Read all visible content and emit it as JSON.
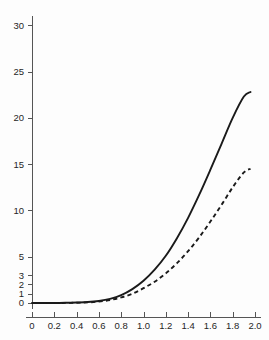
{
  "chart_data": {
    "type": "line",
    "title": "",
    "subtitle": "",
    "xlabel": "",
    "ylabel": "",
    "xlim": [
      0,
      2.0
    ],
    "ylim": [
      0,
      31
    ],
    "grid": false,
    "legend": "none",
    "background_color": "#fdfdfd",
    "axis_color": "#555555",
    "series_color": "#1a1a1a",
    "xticks": [
      0,
      0.2,
      0.4,
      0.6,
      0.8,
      1.0,
      1.2,
      1.4,
      1.6,
      1.8,
      2.0
    ],
    "xtick_labels": [
      "0",
      "0.2",
      "0.4",
      "0.6",
      "0.8",
      "1.0",
      "1.2",
      "1.4",
      "1.6",
      "1.8",
      "2.0"
    ],
    "yticks": [
      0,
      1,
      2,
      3,
      5,
      10,
      15,
      20,
      25,
      30
    ],
    "ytick_labels": [
      "0",
      "1",
      "2",
      "3",
      "5",
      "10",
      "15",
      "20",
      "25",
      "30"
    ],
    "x": [
      0,
      0.1,
      0.2,
      0.3,
      0.4,
      0.5,
      0.6,
      0.7,
      0.8,
      0.9,
      1.0,
      1.1,
      1.2,
      1.3,
      1.4,
      1.5,
      1.6,
      1.7,
      1.8,
      1.9,
      1.96
    ],
    "series": [
      {
        "name": "solid-curve",
        "style": "solid",
        "values": [
          0.0,
          0.0,
          0.0,
          0.02,
          0.05,
          0.1,
          0.22,
          0.45,
          0.85,
          1.5,
          2.4,
          3.6,
          5.1,
          7.0,
          9.2,
          11.7,
          14.4,
          17.2,
          20.0,
          22.3,
          22.8
        ]
      },
      {
        "name": "dashed-curve",
        "style": "dashed",
        "values": [
          0.0,
          0.0,
          0.0,
          0.01,
          0.03,
          0.07,
          0.15,
          0.32,
          0.6,
          1.0,
          1.6,
          2.3,
          3.2,
          4.3,
          5.6,
          7.1,
          8.8,
          10.6,
          12.5,
          14.1,
          14.5
        ]
      }
    ],
    "annotations": []
  },
  "axes": {
    "x_axis_name": "x-axis",
    "y_axis_name": "y-axis"
  }
}
